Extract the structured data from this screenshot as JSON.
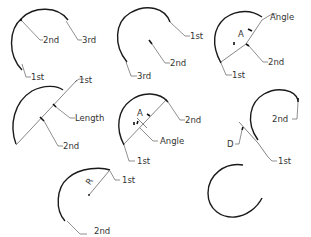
{
  "diagram": {
    "panels": [
      {
        "id": "three-points",
        "labels": {
          "p1": "1st",
          "p2": "2nd",
          "p3": "3rd"
        }
      },
      {
        "id": "start-center-end",
        "labels": {
          "p1": "1st",
          "p2": "2nd",
          "p3": "3rd"
        }
      },
      {
        "id": "start-center-angle",
        "labels": {
          "p1": "1st",
          "p2": "2nd",
          "angle": "Angle",
          "angle_letter": "A"
        }
      },
      {
        "id": "start-center-length",
        "labels": {
          "p1": "1st",
          "p2": "2nd",
          "length": "Length"
        }
      },
      {
        "id": "start-end-angle",
        "labels": {
          "p1": "1st",
          "p2": "2nd",
          "angle": "Angle",
          "angle_letter": "A"
        }
      },
      {
        "id": "start-end-direction",
        "labels": {
          "p1": "1st",
          "p2": "2nd",
          "direction": "D"
        }
      },
      {
        "id": "start-end-radius",
        "labels": {
          "p1": "1st",
          "p2": "2nd",
          "radius": "R"
        }
      },
      {
        "id": "continue",
        "labels": {}
      }
    ]
  }
}
